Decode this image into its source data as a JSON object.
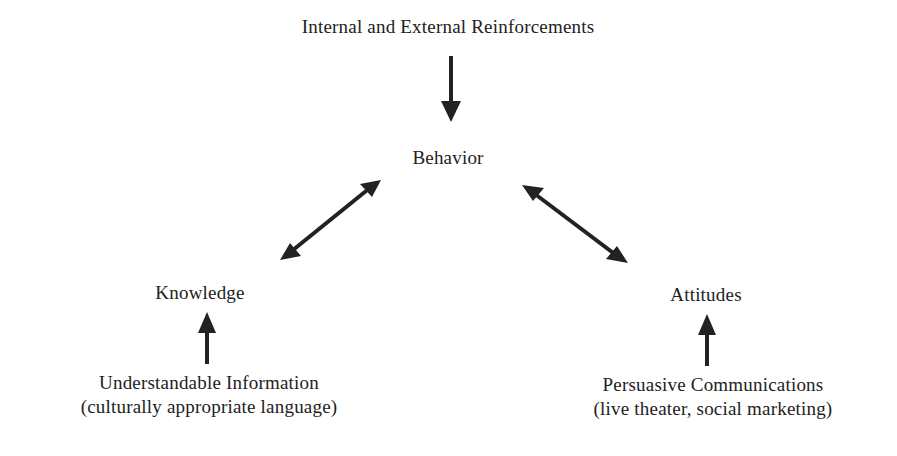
{
  "diagram": {
    "nodes": {
      "reinforcements": {
        "label": "Internal and External Reinforcements"
      },
      "behavior": {
        "label": "Behavior"
      },
      "knowledge": {
        "label": "Knowledge"
      },
      "attitudes": {
        "label": "Attitudes"
      },
      "information": {
        "line1": "Understandable Information",
        "line2": "(culturally appropriate language)"
      },
      "persuasive": {
        "line1": "Persuasive Communications",
        "line2": "(live theater, social marketing)"
      }
    },
    "edges": [
      {
        "from": "Internal and External Reinforcements",
        "to": "Behavior",
        "type": "one-way"
      },
      {
        "from": "Knowledge",
        "to": "Behavior",
        "type": "two-way"
      },
      {
        "from": "Behavior",
        "to": "Attitudes",
        "type": "two-way"
      },
      {
        "from": "Understandable Information",
        "to": "Knowledge",
        "type": "one-way"
      },
      {
        "from": "Persuasive Communications",
        "to": "Attitudes",
        "type": "one-way"
      }
    ],
    "colors": {
      "ink": "#222222",
      "background": "#ffffff"
    }
  }
}
